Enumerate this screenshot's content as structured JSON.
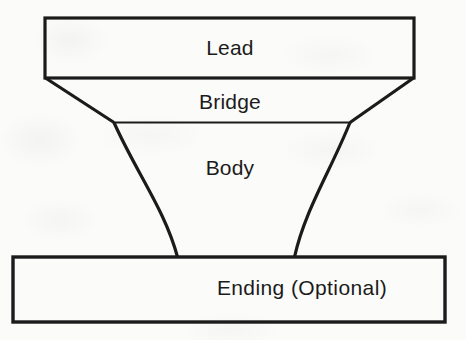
{
  "diagram": {
    "type": "story-structure-diagram",
    "title_present": false,
    "background_color": "#fbfbfa",
    "line_color": "#1b1b1b",
    "sections": [
      {
        "id": "lead",
        "label": "Lead",
        "shape": "rectangle",
        "label_x": 230,
        "label_y": 48,
        "geometry": {
          "x": 45,
          "y": 18,
          "width": 369,
          "height": 60
        }
      },
      {
        "id": "bridge",
        "label": "Bridge",
        "shape": "trapezoid",
        "label_x": 230,
        "label_y": 102,
        "geometry": {
          "top_left_x": 45,
          "top_right_x": 414,
          "bottom_left_x": 114,
          "bottom_right_x": 350,
          "top_y": 78,
          "bottom_y": 122
        }
      },
      {
        "id": "body",
        "label": "Body",
        "shape": "curved-taper",
        "label_x": 230,
        "label_y": 168,
        "geometry": {
          "top_left_x": 114,
          "top_right_x": 350,
          "bottom_left_x": 177,
          "bottom_right_x": 294,
          "top_y": 122,
          "bottom_y": 257
        }
      },
      {
        "id": "ending",
        "label": "Ending   (Optional)",
        "shape": "rectangle",
        "label_x": 302,
        "label_y": 288,
        "geometry": {
          "x": 13,
          "y": 257,
          "width": 432,
          "height": 65
        }
      }
    ]
  }
}
